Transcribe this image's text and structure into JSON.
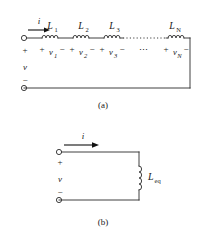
{
  "figure": {
    "subfigures": [
      {
        "caption": "(a)",
        "description": "series inductors",
        "current_label": "i",
        "port_plus": "+",
        "port_minus": "−",
        "port_voltage": "v",
        "ellipsis": "⋯",
        "elements": [
          {
            "inductor_label": "L",
            "inductor_sub": "1",
            "voltage_label": "v",
            "voltage_sub": "1",
            "plus": "+",
            "minus": "−"
          },
          {
            "inductor_label": "L",
            "inductor_sub": "2",
            "voltage_label": "v",
            "voltage_sub": "2",
            "plus": "+",
            "minus": "−"
          },
          {
            "inductor_label": "L",
            "inductor_sub": "3",
            "voltage_label": "v",
            "voltage_sub": "3",
            "plus": "+",
            "minus": "−"
          },
          {
            "inductor_label": "L",
            "inductor_sub": "N",
            "voltage_label": "v",
            "voltage_sub": "N",
            "plus": "+",
            "minus": "−"
          }
        ]
      },
      {
        "caption": "(b)",
        "description": "equivalent inductor",
        "current_label": "i",
        "port_plus": "+",
        "port_minus": "−",
        "port_voltage": "v",
        "equivalent_label": "L",
        "equivalent_sub": "eq"
      }
    ],
    "colors": {
      "ink": "#2a2a2a",
      "background": "#ffffff",
      "arrow": "#111111"
    }
  }
}
